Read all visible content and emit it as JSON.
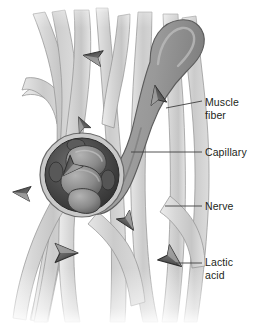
{
  "figure": {
    "background_color": "#ffffff",
    "labels": [
      {
        "id": "muscle-fiber",
        "text": "Muscle\nfiber",
        "color": "#231f20",
        "leader": {
          "x1": 166,
          "y1": 108,
          "x2": 202,
          "y2": 101
        }
      },
      {
        "id": "capillary",
        "text": "Capillary",
        "color": "#231f20",
        "leader": {
          "x1": 131,
          "y1": 152,
          "x2": 202,
          "y2": 152
        }
      },
      {
        "id": "nerve",
        "text": "Nerve",
        "color": "#231f20",
        "leader": {
          "x1": 165,
          "y1": 206,
          "x2": 202,
          "y2": 206
        }
      },
      {
        "id": "lactic-acid",
        "text": "Lactic\nacid",
        "color": "#231f20",
        "leader": {
          "x1": 176,
          "y1": 263,
          "x2": 202,
          "y2": 263
        }
      }
    ],
    "colors": {
      "muscle_fiber_light": "#d9d9d9",
      "muscle_fiber_mid": "#c4c4c4",
      "muscle_fiber_shadow": "#b0b0b0",
      "muscle_fiber_pale": "#ececec",
      "capillary_fill": "#9a9a9a",
      "capillary_shade": "#878787",
      "capillary_highlight": "#b5b5b5",
      "nerve_ring_dark": "#3a3a3a",
      "nerve_fascicle": "#8e8e8e",
      "nerve_fascicle_dark": "#6b6b6b",
      "nerve_sheath": "#c9c9c9",
      "lactic_acid_arrow": "#6e6e6e",
      "lactic_acid_arrow_dark": "#404040",
      "outline": "#585858",
      "leader_line": "#404040"
    },
    "lactic_acid_markers": [
      {
        "id": "marker-1",
        "cx": 93,
        "cy": 57,
        "rotate": 190,
        "size": 15
      },
      {
        "id": "marker-2",
        "cx": 157,
        "cy": 95,
        "rotate": 258,
        "size": 15
      },
      {
        "id": "marker-3",
        "cx": 82,
        "cy": 124,
        "rotate": 244,
        "size": 12
      },
      {
        "id": "marker-4",
        "cx": 70,
        "cy": 168,
        "rotate": 132,
        "size": 16
      },
      {
        "id": "marker-5",
        "cx": 22,
        "cy": 193,
        "rotate": 186,
        "size": 14
      },
      {
        "id": "marker-6",
        "cx": 128,
        "cy": 222,
        "rotate": 56,
        "size": 15
      },
      {
        "id": "marker-7",
        "cx": 66,
        "cy": 253,
        "rotate": 0,
        "size": 18
      },
      {
        "id": "marker-8",
        "cx": 172,
        "cy": 259,
        "rotate": 38,
        "size": 18
      }
    ],
    "structures": {
      "muscle_fiber_count": 9,
      "capillary_shape": "hooked-tube",
      "nerve_cross_section": {
        "cx": 82,
        "cy": 175,
        "r": 42,
        "fascicle_count": 3,
        "satellite_count": 4
      }
    }
  }
}
